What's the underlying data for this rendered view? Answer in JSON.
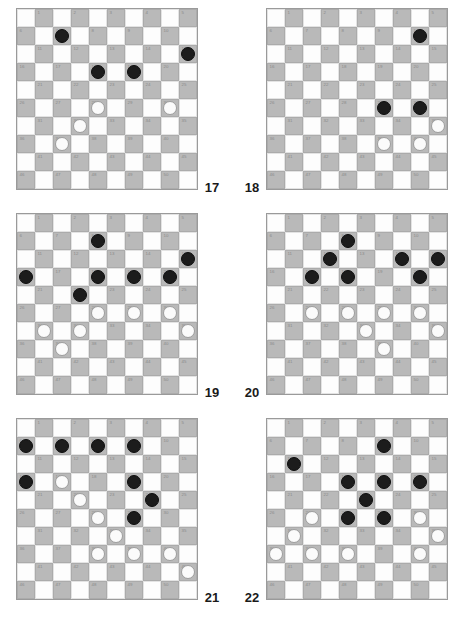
{
  "page": {
    "board_size": 10,
    "numbered_squares": 50,
    "colors": {
      "dark_square": "#b9b9b9",
      "light_square": "#fdfdfd",
      "black_piece": "#1c1c1c",
      "white_piece": "#fbfbfb",
      "square_number": "#8a8a8a",
      "label": "#1a1a1a",
      "background": "#ffffff"
    }
  },
  "square_numbers": [
    1,
    2,
    3,
    4,
    5,
    6,
    7,
    8,
    9,
    10,
    11,
    12,
    13,
    14,
    15,
    16,
    17,
    18,
    19,
    20,
    21,
    22,
    23,
    24,
    25,
    26,
    27,
    28,
    29,
    30,
    31,
    32,
    33,
    34,
    35,
    36,
    37,
    38,
    39,
    40,
    41,
    42,
    43,
    44,
    45,
    46,
    47,
    48,
    49,
    50
  ],
  "diagrams": [
    {
      "label": "17",
      "position": "row0-left",
      "black": [
        7,
        15,
        18,
        19
      ],
      "white": [
        28,
        30,
        32,
        37
      ]
    },
    {
      "label": "18",
      "position": "row0-right",
      "black": [
        10,
        29,
        30
      ],
      "white": [
        35,
        39,
        40
      ]
    },
    {
      "label": "19",
      "position": "row1-left",
      "black": [
        8,
        15,
        16,
        18,
        19,
        20,
        22
      ],
      "white": [
        28,
        29,
        30,
        31,
        32,
        35,
        37
      ]
    },
    {
      "label": "20",
      "position": "row1-right",
      "black": [
        8,
        12,
        14,
        15,
        17,
        18,
        20
      ],
      "white": [
        27,
        28,
        29,
        30,
        33,
        35,
        39
      ]
    },
    {
      "label": "21",
      "position": "row2-left",
      "black": [
        6,
        7,
        8,
        9,
        16,
        19,
        24,
        29
      ],
      "white": [
        17,
        22,
        28,
        33,
        38,
        39,
        40,
        45
      ]
    },
    {
      "label": "22",
      "position": "row2-right",
      "black": [
        9,
        11,
        18,
        19,
        20,
        23,
        28,
        29
      ],
      "white": [
        27,
        30,
        31,
        35,
        36,
        37,
        38,
        40
      ]
    }
  ]
}
